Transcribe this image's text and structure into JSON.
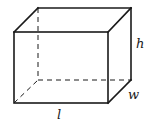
{
  "diagram": {
    "type": "rectangular-prism",
    "labels": {
      "height": "h",
      "width": "w",
      "length": "l"
    },
    "colors": {
      "stroke": "#1a1a1a",
      "background": "#ffffff"
    }
  }
}
